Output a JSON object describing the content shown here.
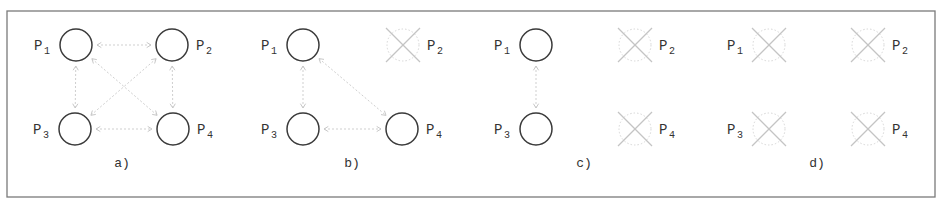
{
  "figure": {
    "frame": {
      "x": 7,
      "y": 11,
      "width": 928,
      "height": 186
    },
    "colors": {
      "alive_stroke": "#3a3a3a",
      "dead_stroke": "#c4c4c4",
      "link": "#cfcfcf",
      "frame": "#7a7a7a",
      "text": "#333333"
    },
    "node_radius": 16,
    "panels": [
      {
        "caption": "a)",
        "caption_pos": [
          122,
          163
        ],
        "nodes": [
          {
            "id": "P1",
            "label": "P",
            "sub": "1",
            "x": 76,
            "y": 45,
            "state": "alive",
            "label_side": "left"
          },
          {
            "id": "P2",
            "label": "P",
            "sub": "2",
            "x": 172,
            "y": 45,
            "state": "alive",
            "label_side": "right"
          },
          {
            "id": "P3",
            "label": "P",
            "sub": "3",
            "x": 75,
            "y": 129,
            "state": "alive",
            "label_side": "left"
          },
          {
            "id": "P4",
            "label": "P",
            "sub": "4",
            "x": 173,
            "y": 129,
            "state": "alive",
            "label_side": "right"
          }
        ],
        "links": [
          [
            "P1",
            "P2"
          ],
          [
            "P1",
            "P3"
          ],
          [
            "P1",
            "P4"
          ],
          [
            "P2",
            "P3"
          ],
          [
            "P2",
            "P4"
          ],
          [
            "P3",
            "P4"
          ]
        ]
      },
      {
        "caption": "b)",
        "caption_pos": [
          352,
          163
        ],
        "nodes": [
          {
            "id": "P1",
            "label": "P",
            "sub": "1",
            "x": 303,
            "y": 45,
            "state": "alive",
            "label_side": "left"
          },
          {
            "id": "P2",
            "label": "P",
            "sub": "2",
            "x": 403,
            "y": 45,
            "state": "failed",
            "label_side": "right"
          },
          {
            "id": "P3",
            "label": "P",
            "sub": "3",
            "x": 303,
            "y": 129,
            "state": "alive",
            "label_side": "left"
          },
          {
            "id": "P4",
            "label": "P",
            "sub": "4",
            "x": 402,
            "y": 129,
            "state": "alive",
            "label_side": "right"
          }
        ],
        "links": [
          [
            "P1",
            "P3"
          ],
          [
            "P1",
            "P4"
          ],
          [
            "P3",
            "P4"
          ]
        ]
      },
      {
        "caption": "c)",
        "caption_pos": [
          584,
          163
        ],
        "nodes": [
          {
            "id": "P1",
            "label": "P",
            "sub": "1",
            "x": 536,
            "y": 45,
            "state": "alive",
            "label_side": "left"
          },
          {
            "id": "P2",
            "label": "P",
            "sub": "2",
            "x": 635,
            "y": 45,
            "state": "failed",
            "label_side": "right"
          },
          {
            "id": "P3",
            "label": "P",
            "sub": "3",
            "x": 536,
            "y": 129,
            "state": "alive",
            "label_side": "left"
          },
          {
            "id": "P4",
            "label": "P",
            "sub": "4",
            "x": 635,
            "y": 129,
            "state": "failed",
            "label_side": "right"
          }
        ],
        "links": [
          [
            "P1",
            "P3"
          ]
        ]
      },
      {
        "caption": "d)",
        "caption_pos": [
          817,
          163
        ],
        "nodes": [
          {
            "id": "P1",
            "label": "P",
            "sub": "1",
            "x": 769,
            "y": 45,
            "state": "failed",
            "label_side": "left"
          },
          {
            "id": "P2",
            "label": "P",
            "sub": "2",
            "x": 868,
            "y": 45,
            "state": "failed",
            "label_side": "right"
          },
          {
            "id": "P3",
            "label": "P",
            "sub": "3",
            "x": 769,
            "y": 129,
            "state": "failed",
            "label_side": "left"
          },
          {
            "id": "P4",
            "label": "P",
            "sub": "4",
            "x": 868,
            "y": 129,
            "state": "failed",
            "label_side": "right"
          }
        ],
        "links": []
      }
    ]
  }
}
